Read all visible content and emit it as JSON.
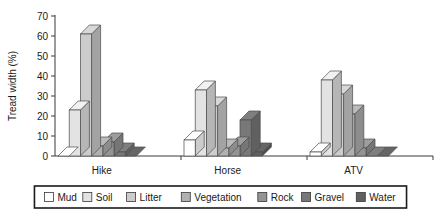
{
  "chart_data": {
    "type": "bar",
    "title": "",
    "subtitle": "",
    "xlabel": "",
    "ylabel": "Tread width (%)",
    "ylim": [
      0,
      70
    ],
    "yticks": [
      0,
      10,
      20,
      30,
      40,
      50,
      60,
      70
    ],
    "ytick_labels": [
      "0",
      "10",
      "20",
      "30",
      "40",
      "50",
      "60",
      "70"
    ],
    "grid": false,
    "three_d": true,
    "legend_position": "bottom",
    "categories": [
      "Hike",
      "Horse",
      "ATV"
    ],
    "series": [
      {
        "name": "Mud",
        "color": "#ffffff",
        "values": [
          0,
          8,
          2
        ]
      },
      {
        "name": "Soil",
        "color": "#e3e3e3",
        "values": [
          23,
          33,
          38
        ]
      },
      {
        "name": "Litter",
        "color": "#cccccc",
        "values": [
          61,
          25,
          31
        ]
      },
      {
        "name": "Vegetation",
        "color": "#b0b0b0",
        "values": [
          5,
          4,
          21
        ]
      },
      {
        "name": "Rock",
        "color": "#949494",
        "values": [
          7,
          5,
          4
        ]
      },
      {
        "name": "Gravel",
        "color": "#787878",
        "values": [
          2,
          18,
          0
        ]
      },
      {
        "name": "Water",
        "color": "#606060",
        "values": [
          0,
          2,
          0
        ]
      }
    ]
  },
  "legend": {
    "items": [
      {
        "label": "Mud",
        "swatch": "#ffffff"
      },
      {
        "label": "Soil",
        "swatch": "#e3e3e3"
      },
      {
        "label": "Litter",
        "swatch": "#cccccc"
      },
      {
        "label": "Vegetation",
        "swatch": "#b0b0b0"
      },
      {
        "label": "Rock",
        "swatch": "#949494"
      },
      {
        "label": "Gravel",
        "swatch": "#787878"
      },
      {
        "label": "Water",
        "swatch": "#606060"
      }
    ]
  }
}
